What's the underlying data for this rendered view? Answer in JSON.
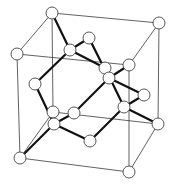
{
  "diagram": {
    "title": "Diamond cubic crystal structure (unit cell)",
    "colors": {
      "background": "#ffffff",
      "cube_edge": "#3a3a3a",
      "bond": "#111111",
      "atom_fill": "#ffffff",
      "atom_stroke": "#444444"
    },
    "atom_radius": 6,
    "atoms": [
      {
        "id": "corner-top-back-left",
        "x": 52,
        "y": 13
      },
      {
        "id": "corner-top-back-right",
        "x": 159,
        "y": 23
      },
      {
        "id": "corner-top-front-left",
        "x": 17,
        "y": 54
      },
      {
        "id": "corner-top-front-right",
        "x": 129,
        "y": 65
      },
      {
        "id": "corner-bottom-back-left",
        "x": 53,
        "y": 112
      },
      {
        "id": "corner-bottom-back-right",
        "x": 158,
        "y": 124
      },
      {
        "id": "corner-bottom-front-left",
        "x": 20,
        "y": 158
      },
      {
        "id": "corner-bottom-front-right",
        "x": 129,
        "y": 172
      },
      {
        "id": "face-top",
        "x": 89,
        "y": 38
      },
      {
        "id": "face-back",
        "x": 105,
        "y": 68
      },
      {
        "id": "face-left",
        "x": 35,
        "y": 84
      },
      {
        "id": "face-right",
        "x": 144,
        "y": 95
      },
      {
        "id": "face-front",
        "x": 74,
        "y": 113
      },
      {
        "id": "face-bottom",
        "x": 90,
        "y": 141
      },
      {
        "id": "interior-1",
        "x": 70,
        "y": 50
      },
      {
        "id": "interior-2",
        "x": 109,
        "y": 78
      },
      {
        "id": "interior-3",
        "x": 124,
        "y": 107
      },
      {
        "id": "interior-4",
        "x": 54,
        "y": 124
      }
    ],
    "cube_edges": [
      [
        "corner-top-back-left",
        "corner-top-back-right"
      ],
      [
        "corner-top-back-left",
        "corner-top-front-left"
      ],
      [
        "corner-top-front-left",
        "corner-top-front-right"
      ],
      [
        "corner-top-back-right",
        "corner-top-front-right"
      ],
      [
        "corner-bottom-back-left",
        "corner-bottom-back-right"
      ],
      [
        "corner-bottom-back-left",
        "corner-bottom-front-left"
      ],
      [
        "corner-bottom-front-left",
        "corner-bottom-front-right"
      ],
      [
        "corner-bottom-back-right",
        "corner-bottom-front-right"
      ],
      [
        "corner-top-back-left",
        "corner-bottom-back-left"
      ],
      [
        "corner-top-back-right",
        "corner-bottom-back-right"
      ],
      [
        "corner-top-front-left",
        "corner-bottom-front-left"
      ],
      [
        "corner-top-front-right",
        "corner-bottom-front-right"
      ]
    ],
    "bonds": [
      [
        "interior-1",
        "corner-top-back-left"
      ],
      [
        "interior-1",
        "face-top"
      ],
      [
        "interior-1",
        "face-left"
      ],
      [
        "interior-1",
        "face-back"
      ],
      [
        "interior-2",
        "face-top"
      ],
      [
        "interior-2",
        "corner-top-front-right"
      ],
      [
        "interior-2",
        "face-right"
      ],
      [
        "interior-2",
        "face-front"
      ],
      [
        "interior-3",
        "face-back"
      ],
      [
        "interior-3",
        "face-right"
      ],
      [
        "interior-3",
        "corner-bottom-back-right"
      ],
      [
        "interior-3",
        "face-bottom"
      ],
      [
        "interior-4",
        "face-left"
      ],
      [
        "interior-4",
        "face-front"
      ],
      [
        "interior-4",
        "corner-bottom-front-left"
      ],
      [
        "interior-4",
        "face-bottom"
      ]
    ]
  }
}
